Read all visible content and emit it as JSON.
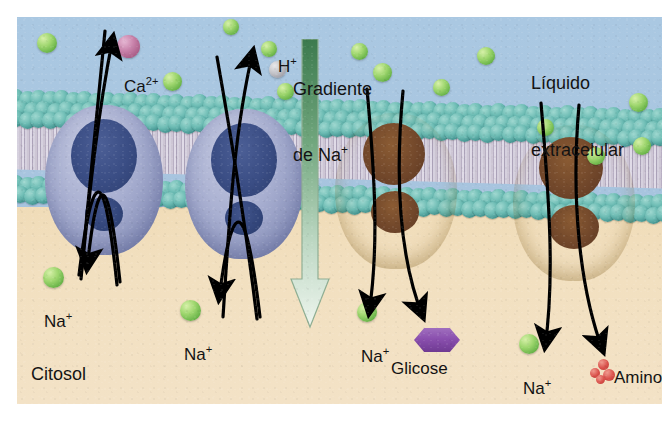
{
  "figure": {
    "colors": {
      "extracellular_fluid": "#a9c6e0",
      "cytosol": "#f2e0c0",
      "membrane_head": "#6dbcb4",
      "membrane_tail": "#c9c0d2",
      "pump_blue": "#a7aed0",
      "pump_blue_cavity": "#3a4d84",
      "pump_gold": "#d9b155",
      "pump_gold_cavity": "#70462a",
      "sodium_ion": "#9ed66e",
      "calcium_ion": "#c983ab",
      "hydrogen_ion": "#c3c3c8",
      "glucose": "#8a4fae",
      "amino_acid": "#d9504a",
      "gradient_arrow_top": "#3c7a4e",
      "gradient_arrow_bottom": "#eef5ee",
      "arrow_stroke": "#000000"
    },
    "regions": [
      {
        "name": "extracellular",
        "label": "Líquido\nextracelular"
      },
      {
        "name": "cytosol",
        "label": "Citosol"
      }
    ],
    "gradient_label": "Gradiente\nde Na",
    "gradient_label_sup": "+",
    "transporters": [
      {
        "id": "na-ca-exchanger",
        "type": "antiporter",
        "color": "blue",
        "exported_ion": "Ca",
        "exported_sup": "2+",
        "imported_ion": "Na",
        "imported_sup": "+"
      },
      {
        "id": "na-h-exchanger",
        "type": "antiporter",
        "color": "blue",
        "exported_ion": "H",
        "exported_sup": "+",
        "imported_ion": "Na",
        "imported_sup": "+"
      },
      {
        "id": "na-glucose-symporter",
        "type": "symporter",
        "color": "gold",
        "cotransported": "Glicose",
        "imported_ion": "Na",
        "imported_sup": "+"
      },
      {
        "id": "na-aminoacid-symporter",
        "type": "symporter",
        "color": "gold",
        "cotransported": "Amino-\nácido",
        "imported_ion": "Na",
        "imported_sup": "+"
      }
    ],
    "labels": {
      "calcium": "Ca",
      "calcium_sup": "2+",
      "hydrogen": "H",
      "hydrogen_sup": "+",
      "sodium": "Na",
      "sodium_sup": "+",
      "glucose": "Glicose",
      "amino_acid_line1": "Amino-",
      "amino_acid_line2": "ácido",
      "extracellular_line1": "Líquido",
      "extracellular_line2": "extracelular",
      "cytosol": "Citosol",
      "gradient_line1": "Gradiente",
      "gradient_line2": "de Na"
    }
  }
}
